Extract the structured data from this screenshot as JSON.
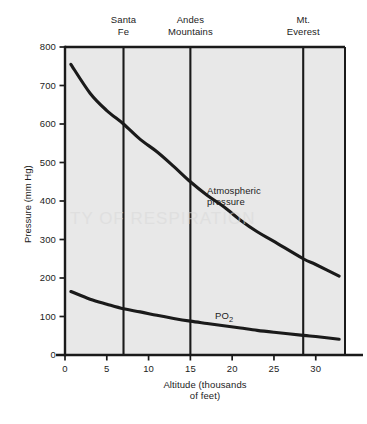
{
  "figure": {
    "background": "#ffffff",
    "plot_fill": "#e8e8e8",
    "axis_color": "#1a1a1a",
    "curve_color": "#1a1a1a",
    "watermark_text": "TY OF RESPIRATION"
  },
  "axes": {
    "ylabel": "Pressure (mm Hg)",
    "xlabel_line1": "Altitude (thousands",
    "xlabel_line2": "of feet)",
    "yticks": [
      "0",
      "100",
      "200",
      "300",
      "400",
      "500",
      "600",
      "700",
      "800"
    ],
    "xticks": [
      "0",
      "5",
      "10",
      "15",
      "20",
      "25",
      "30"
    ]
  },
  "markers": [
    {
      "name": "santa-fe",
      "line1": "Santa",
      "line2": "Fe",
      "x": 7.0
    },
    {
      "name": "andes",
      "line1": "Andes",
      "line2": "Mountains",
      "x": 15.0
    },
    {
      "name": "mt-everest",
      "line1": "Mt.",
      "line2": "Everest",
      "x": 28.5
    }
  ],
  "curve_labels": {
    "atmospheric_line1": "Atmospheric",
    "atmospheric_line2": "pressure",
    "po2_main": "PO",
    "po2_sub": "2"
  },
  "chart_data": {
    "type": "line",
    "title": "",
    "xlabel": "Altitude (thousands of feet)",
    "ylabel": "Pressure (mm Hg)",
    "xlim": [
      0,
      33.5
    ],
    "ylim": [
      0,
      800
    ],
    "grid": false,
    "legend": "inline-annotations",
    "xticks": [
      0,
      5,
      10,
      15,
      20,
      25,
      30
    ],
    "yticks": [
      0,
      100,
      200,
      300,
      400,
      500,
      600,
      700,
      800
    ],
    "vertical_markers": [
      {
        "label": "Santa Fe",
        "x": 7.0
      },
      {
        "label": "Andes Mountains",
        "x": 15.0
      },
      {
        "label": "Mt. Everest",
        "x": 28.5
      }
    ],
    "series": [
      {
        "name": "Atmospheric pressure",
        "x": [
          0.7,
          3,
          5,
          7,
          9,
          11,
          13,
          15,
          17,
          19,
          21,
          23,
          25,
          28.5,
          30,
          32.8
        ],
        "values": [
          755,
          680,
          635,
          600,
          560,
          528,
          490,
          450,
          415,
          385,
          350,
          320,
          295,
          250,
          235,
          205
        ]
      },
      {
        "name": "PO2",
        "x": [
          0.7,
          3,
          5,
          7,
          9,
          11,
          13,
          15,
          17,
          19,
          21,
          23,
          25,
          28.5,
          30,
          32.8
        ],
        "values": [
          165,
          145,
          132,
          120,
          112,
          103,
          95,
          88,
          82,
          76,
          70,
          64,
          59,
          51,
          48,
          41
        ]
      }
    ]
  }
}
